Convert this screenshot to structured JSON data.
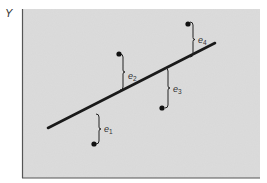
{
  "diagram": {
    "title": "",
    "y_axis_label": "Y",
    "plot_area": {
      "x": 22,
      "y": 9,
      "width": 238,
      "height": 169,
      "fill": "#dcdcdc",
      "border": "#555555"
    },
    "regression_line": {
      "x1": 48,
      "y1": 128,
      "x2": 215,
      "y2": 43,
      "color": "#1a1a1a",
      "width": 2.6
    },
    "points": [
      {
        "id": "p1",
        "x": 94,
        "y": 144,
        "residual": {
          "label_base": "e",
          "label_sub": "1",
          "brace_x": 99,
          "y_top": 114,
          "y_bottom": 144,
          "label_x": 104,
          "label_y": 132
        }
      },
      {
        "id": "p2",
        "x": 119,
        "y": 54,
        "residual": {
          "label_base": "e",
          "label_sub": "2",
          "brace_x": 123,
          "y_top": 54,
          "y_bottom": 90,
          "label_x": 128,
          "label_y": 79
        }
      },
      {
        "id": "p3",
        "x": 162,
        "y": 108,
        "residual": {
          "label_base": "e",
          "label_sub": "3",
          "brace_x": 168,
          "y_top": 68,
          "y_bottom": 108,
          "label_x": 173,
          "label_y": 92
        }
      },
      {
        "id": "p4",
        "x": 188,
        "y": 24,
        "residual": {
          "label_base": "e",
          "label_sub": "4",
          "brace_x": 193,
          "y_top": 22,
          "y_bottom": 57,
          "label_x": 198,
          "label_y": 43
        }
      }
    ],
    "colors": {
      "point": "#111111",
      "brace": "#222222",
      "text": "#333333"
    }
  }
}
